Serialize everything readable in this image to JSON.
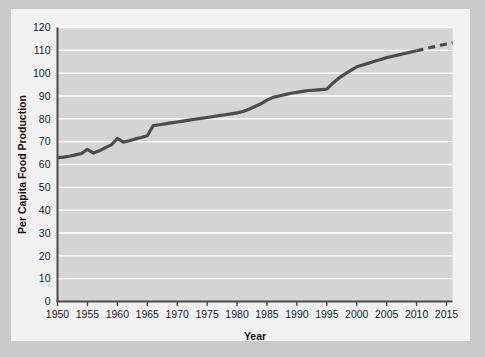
{
  "chart_data": {
    "type": "line",
    "title": "",
    "xlabel": "Year",
    "ylabel": "Per Capita Food Production",
    "xlim": [
      1950,
      2016
    ],
    "ylim": [
      0,
      120
    ],
    "xticks": [
      1950,
      1955,
      1960,
      1965,
      1970,
      1975,
      1980,
      1985,
      1990,
      1995,
      2000,
      2005,
      2010,
      2015
    ],
    "yticks": [
      0,
      10,
      20,
      30,
      40,
      50,
      60,
      70,
      80,
      90,
      100,
      110,
      120
    ],
    "grid": "horizontal-white",
    "legend": "none",
    "plot_bgcolor": "#d4d4d4",
    "figure_bgcolor": "#f2f2f2",
    "page_bgcolor": "#c9c9c9",
    "line_color": "#4d4d4d",
    "line_width": 3.2,
    "series": [
      {
        "name": "Per Capita Food Production",
        "style": "solid",
        "x": [
          1950,
          1951,
          1952,
          1953,
          1954,
          1955,
          1956,
          1957,
          1958,
          1959,
          1960,
          1961,
          1962,
          1963,
          1964,
          1965,
          1966,
          1967,
          1968,
          1969,
          1970,
          1971,
          1972,
          1973,
          1974,
          1975,
          1976,
          1977,
          1978,
          1979,
          1980,
          1981,
          1982,
          1983,
          1984,
          1985,
          1986,
          1987,
          1988,
          1989,
          1990,
          1991,
          1992,
          1993,
          1994,
          1995,
          1996,
          1997,
          1998,
          1999,
          2000,
          2001,
          2002,
          2003,
          2004,
          2005,
          2006,
          2007,
          2008,
          2009,
          2010
        ],
        "y": [
          63.0,
          63.2,
          63.6,
          64.2,
          64.8,
          66.6,
          65.0,
          66.0,
          67.4,
          68.6,
          71.4,
          69.8,
          70.4,
          71.2,
          71.8,
          72.6,
          77.0,
          77.4,
          77.8,
          78.2,
          78.6,
          79.0,
          79.4,
          79.8,
          80.2,
          80.6,
          81.0,
          81.4,
          81.8,
          82.2,
          82.6,
          83.2,
          84.2,
          85.4,
          86.6,
          88.2,
          89.4,
          90.0,
          90.6,
          91.2,
          91.6,
          92.0,
          92.4,
          92.6,
          92.8,
          93.0,
          95.6,
          97.8,
          99.6,
          101.2,
          102.8,
          103.6,
          104.4,
          105.2,
          106.0,
          106.8,
          107.4,
          108.0,
          108.6,
          109.2,
          109.8
        ]
      },
      {
        "name": "Projection",
        "style": "dashed",
        "x": [
          2010,
          2011,
          2012,
          2013,
          2014,
          2015,
          2016
        ],
        "y": [
          109.8,
          110.4,
          111.0,
          111.6,
          112.2,
          112.8,
          113.4
        ]
      }
    ]
  }
}
